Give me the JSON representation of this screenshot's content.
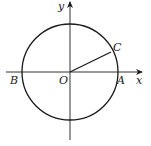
{
  "diagram": {
    "type": "unit-circle",
    "origin": {
      "x": 70,
      "y": 72
    },
    "radius": 48,
    "stroke_color": "#1a1a1a",
    "axis_color": "#333333",
    "axes": {
      "x_label": "x",
      "y_label": "y"
    },
    "points": {
      "origin": "O",
      "a": "A",
      "b": "B",
      "c": "C"
    },
    "segment": {
      "from": "O",
      "to": "C",
      "angle_deg": 25
    }
  }
}
